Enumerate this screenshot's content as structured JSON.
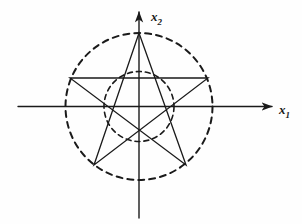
{
  "figure": {
    "background_color": "#fefefe",
    "ink_color": "#1a1a1a",
    "axes": {
      "horizontal": {
        "name": "x-axis",
        "label_var": "x",
        "label_sub": "1",
        "start": [
          18,
          106.5
        ],
        "end": [
          272,
          106.5
        ],
        "arrow": "right",
        "stroke_width": 1.4
      },
      "vertical": {
        "name": "y-axis",
        "label_var": "x",
        "label_sub": "2",
        "start": [
          139,
          218
        ],
        "end": [
          139,
          12
        ],
        "arrow": "up",
        "stroke_width": 1.4
      },
      "origin": [
        139,
        106.5
      ]
    },
    "circles": [
      {
        "name": "outer-dashed-circle",
        "cx": 139,
        "cy": 106.5,
        "r": 73.5,
        "style": "dashed",
        "dash": "6 5",
        "stroke_width": 2.0
      },
      {
        "name": "inner-dashed-circle",
        "cx": 139,
        "cy": 106.5,
        "r": 35,
        "style": "dashed",
        "dash": "5 4",
        "stroke_width": 1.6
      }
    ],
    "pentagram": {
      "name": "pentagram",
      "style": "solid",
      "stroke_width": 1.3,
      "vertices": [
        {
          "name": "vertex-top",
          "x": 139,
          "y": 33
        },
        {
          "name": "vertex-right",
          "x": 208,
          "y": 78
        },
        {
          "name": "vertex-bottom-right",
          "x": 186,
          "y": 165
        },
        {
          "name": "vertex-bottom-left",
          "x": 94,
          "y": 165
        },
        {
          "name": "vertex-left",
          "x": 70,
          "y": 78
        }
      ],
      "edge_order": [
        0,
        2,
        4,
        1,
        3,
        0
      ]
    },
    "labels": {
      "x_axis": {
        "var": "x",
        "sub": "1"
      },
      "y_axis": {
        "var": "x",
        "sub": "2"
      }
    }
  }
}
